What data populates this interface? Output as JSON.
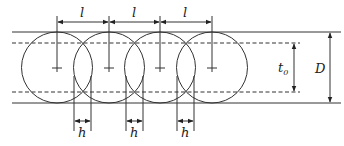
{
  "diagram": {
    "type": "overlapping-circles-weld-overlap",
    "labels": {
      "pitch": "l",
      "overlap": "h",
      "effective_thickness": "t",
      "effective_thickness_sub": "0",
      "diameter": "D"
    },
    "circle_count": 4,
    "pitch_dimension_count": 3,
    "overlap_dimension_count": 3,
    "colors": {
      "stroke": "#333333",
      "background": "#ffffff"
    }
  }
}
